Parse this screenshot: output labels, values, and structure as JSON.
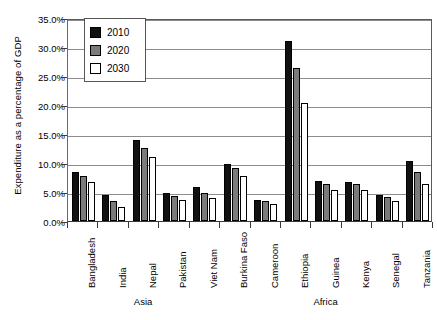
{
  "chart_data": {
    "type": "bar",
    "title": "",
    "xlabel": "",
    "ylabel": "Expenditure as a percentage of GDP",
    "ylim": [
      0,
      35
    ],
    "ytick_labels": [
      "0.0%",
      "5.0%",
      "10.0%",
      "15.0%",
      "20.0%",
      "25.0%",
      "30.0%",
      "35.0%"
    ],
    "ytick_values": [
      0,
      5,
      10,
      15,
      20,
      25,
      30,
      35
    ],
    "grid": true,
    "legend_position": "top-left",
    "units": "percent",
    "categories": [
      "Bangladesh",
      "India",
      "Nepal",
      "Pakistan",
      "Viet Nam",
      "Burkina Faso",
      "Cameroon",
      "Ethiopia",
      "Guinea",
      "Kenya",
      "Senegal",
      "Tanzania"
    ],
    "series": [
      {
        "name": "2010",
        "color": "#111111",
        "values": [
          8.5,
          4.5,
          13.9,
          4.8,
          5.8,
          9.8,
          3.7,
          31.0,
          6.9,
          6.7,
          4.4,
          10.3
        ]
      },
      {
        "name": "2020",
        "color": "#7b7b7b",
        "values": [
          7.7,
          3.4,
          12.6,
          4.3,
          4.9,
          9.1,
          3.5,
          26.3,
          6.4,
          6.3,
          4.1,
          8.4
        ]
      },
      {
        "name": "2030",
        "color": "#ffffff",
        "values": [
          6.8,
          2.5,
          11.0,
          3.6,
          3.9,
          7.8,
          3.0,
          20.4,
          5.3,
          5.4,
          3.4,
          6.3
        ]
      }
    ],
    "region_groups": [
      {
        "label": "Asia",
        "categories": [
          "Bangladesh",
          "India",
          "Nepal",
          "Pakistan",
          "Viet Nam"
        ]
      },
      {
        "label": "Africa",
        "categories": [
          "Burkina Faso",
          "Cameroon",
          "Ethiopia",
          "Guinea",
          "Kenya",
          "Senegal",
          "Tanzania"
        ]
      }
    ]
  },
  "legend": {
    "entries": [
      {
        "label": "2010",
        "swatch": "black-swatch"
      },
      {
        "label": "2020",
        "swatch": "gray-swatch"
      },
      {
        "label": "2030",
        "swatch": "white-swatch"
      }
    ]
  }
}
